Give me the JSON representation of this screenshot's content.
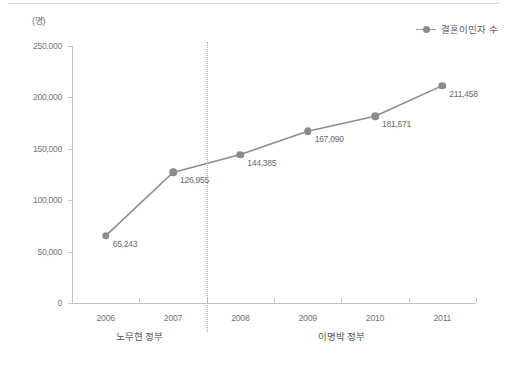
{
  "chart_data": {
    "type": "line",
    "title": "",
    "subtitle": "",
    "xlabel": "",
    "ylabel": "",
    "unit_label": "(명)",
    "categories": [
      "2006",
      "2007",
      "2008",
      "2009",
      "2010",
      "2011"
    ],
    "series": [
      {
        "name": "결혼이민자 수",
        "values": [
          65243,
          126955,
          144385,
          167090,
          181671,
          211458
        ],
        "value_labels": [
          "65,243",
          "126,955",
          "144,385",
          "167,090",
          "181,671",
          "211,458"
        ],
        "color": "#8c8c8c"
      }
    ],
    "ylim": [
      0,
      250000
    ],
    "ytick_values": [
      0,
      50000,
      100000,
      150000,
      200000,
      250000
    ],
    "ytick_labels": [
      "0",
      "50,000",
      "100,000",
      "150,000",
      "200,000",
      "250,000"
    ],
    "grid": false,
    "legend_position": "top-right",
    "annotations": {
      "divider": {
        "between": [
          "2007",
          "2008"
        ],
        "style": "dotted",
        "color": "#c0a8a8"
      },
      "groups": [
        {
          "label": "노무현 정부",
          "categories": [
            "2006",
            "2007"
          ]
        },
        {
          "label": "이명박 정부",
          "categories": [
            "2008",
            "2009",
            "2010",
            "2011"
          ]
        }
      ]
    }
  },
  "legend": {
    "label": "결혼이민자 수"
  },
  "axes": {
    "unit": "(명)"
  },
  "footer": {
    "source": ""
  }
}
